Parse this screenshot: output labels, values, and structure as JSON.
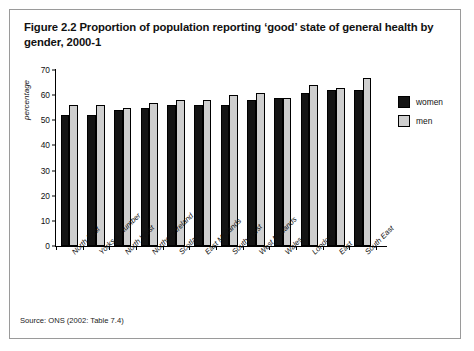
{
  "figure": {
    "title": "Figure 2.2 Proportion of population reporting ‘good’ state of general health by gender, 2000-1",
    "source": "Source: ONS (2002: Table 7.4)"
  },
  "legend": {
    "items": [
      {
        "label": "women",
        "color": "#141414"
      },
      {
        "label": "men",
        "color": "#cfcfcf"
      }
    ]
  },
  "axis": {
    "ylabel": "percentage",
    "yticks": [
      "0",
      "10",
      "20",
      "30",
      "40",
      "50",
      "60",
      "70"
    ]
  },
  "chart_data": {
    "type": "bar",
    "title": "Figure 2.2 Proportion of population reporting ‘good’ state of general health by gender, 2000-1",
    "xlabel": "",
    "ylabel": "percentage",
    "ylim": [
      0,
      70
    ],
    "ytick_step": 10,
    "grid": false,
    "legend_position": "right",
    "categories": [
      "North East",
      "Yorks & Humber",
      "North West",
      "Northern Ireland",
      "Scotland",
      "East Midlands",
      "South West",
      "West Midlands",
      "Wales",
      "London",
      "East",
      "South East"
    ],
    "series": [
      {
        "name": "women",
        "color": "#141414",
        "values": [
          52,
          52,
          54,
          55,
          56,
          56,
          56,
          58,
          59,
          61,
          62,
          62
        ]
      },
      {
        "name": "men",
        "color": "#cfcfcf",
        "values": [
          56,
          56,
          55,
          57,
          58,
          58,
          60,
          61,
          59,
          64,
          63,
          67
        ]
      }
    ]
  }
}
